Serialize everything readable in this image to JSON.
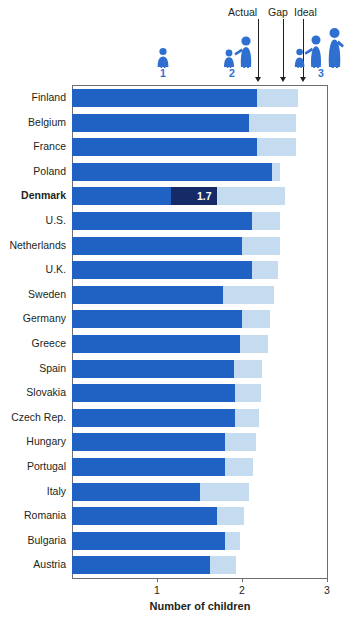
{
  "annotations": {
    "actual": "Actual",
    "gap": "Gap",
    "ideal": "Ideal"
  },
  "icon_legend": [
    {
      "name": "one-child-family-icon",
      "count": "1"
    },
    {
      "name": "two-child-family-icon",
      "count": "2"
    },
    {
      "name": "three-child-family-icon",
      "count": "3"
    }
  ],
  "colors": {
    "actual": "#1f62c4",
    "ideal": "#c5dcf0",
    "highlight": "#152a66",
    "axis": "#6d6e71",
    "icon": "#2f6fd0",
    "text": "#231f20"
  },
  "chart_data": {
    "type": "bar",
    "orientation": "horizontal",
    "stacked": true,
    "title": "",
    "xlabel": "Number of children",
    "ylabel": "",
    "xlim": [
      0,
      3.0
    ],
    "xticks": [
      1,
      2,
      3
    ],
    "xticklabels": [
      "1",
      "2",
      "3"
    ],
    "grid": false,
    "legend_position": "top",
    "series": [
      {
        "name": "Actual",
        "color": "#1f62c4"
      },
      {
        "name": "Gap",
        "color": "#c5dcf0"
      },
      {
        "name": "Ideal",
        "color": "#c5dcf0"
      }
    ],
    "highlight": {
      "category": "Denmark",
      "value_label": "1.7",
      "color": "#152a66"
    },
    "categories": [
      "Finland",
      "Belgium",
      "France",
      "Poland",
      "Denmark",
      "U.S.",
      "Netherlands",
      "U.K.",
      "Sweden",
      "Germany",
      "Greece",
      "Spain",
      "Slovakia",
      "Czech Rep.",
      "Hungary",
      "Portugal",
      "Italy",
      "Romania",
      "Bulgaria",
      "Austria"
    ],
    "actual": [
      2.18,
      2.08,
      2.18,
      2.35,
      1.7,
      2.12,
      2.0,
      2.12,
      1.78,
      2.0,
      1.98,
      1.9,
      1.92,
      1.92,
      1.8,
      1.8,
      1.5,
      1.7,
      1.8,
      1.62
    ],
    "ideal": [
      2.66,
      2.64,
      2.63,
      2.45,
      2.5,
      2.45,
      2.45,
      2.42,
      2.38,
      2.33,
      2.3,
      2.24,
      2.22,
      2.2,
      2.16,
      2.13,
      2.08,
      2.02,
      1.98,
      1.93
    ]
  }
}
